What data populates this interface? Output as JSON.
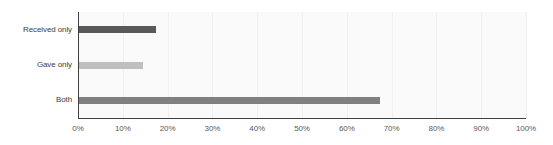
{
  "chart_data": {
    "type": "bar",
    "orientation": "horizontal",
    "title": "",
    "subtitle": "",
    "xlabel": "",
    "ylabel": "",
    "categories": [
      "Received only",
      "Gave only",
      "Both"
    ],
    "values": [
      17.5,
      14.5,
      67.5
    ],
    "value_suffix": "%",
    "xlim": [
      0,
      100
    ],
    "xticks": [
      0,
      10,
      20,
      30,
      40,
      50,
      60,
      70,
      80,
      90,
      100
    ],
    "xtick_labels": [
      "0%",
      "10%",
      "20%",
      "30%",
      "40%",
      "50%",
      "60%",
      "70%",
      "80%",
      "90%",
      "100%"
    ],
    "bar_colors": [
      "#595959",
      "#bfbfbf",
      "#808080"
    ],
    "grid": {
      "vertical": true,
      "horizontal": false,
      "color": "#f0f0f0"
    },
    "legend": {
      "visible": false,
      "position": "none"
    },
    "plot_background": "#fafafa",
    "axis_color": "#3f3f3f",
    "series": [
      {
        "name": "Received only",
        "value": 17.5,
        "color": "#595959"
      },
      {
        "name": "Gave only",
        "value": 14.5,
        "color": "#bfbfbf"
      },
      {
        "name": "Both",
        "value": 67.5,
        "color": "#808080"
      }
    ]
  }
}
